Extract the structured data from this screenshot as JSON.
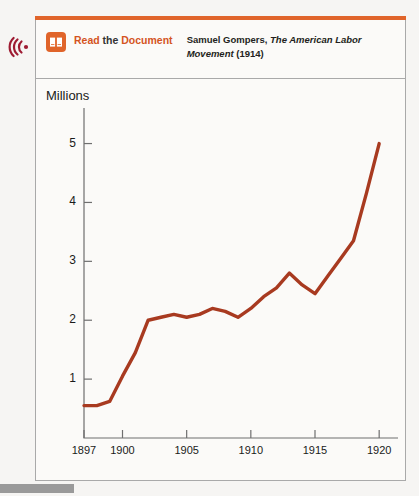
{
  "callout": {
    "audio_icon": "audio-listen-icon",
    "book_icon": "open-book-icon",
    "read_label_1": "Read",
    "read_label_2": " the ",
    "read_label_3": "Document",
    "citation_author": "Samuel Gompers, ",
    "citation_title": "The American Labor Movement",
    "citation_year": " (1914)"
  },
  "colors": {
    "accent_orange": "#e0642a",
    "line_red": "#a83a20",
    "border_gray": "#a9a9a9",
    "text_dark": "#231f20"
  },
  "chart_data": {
    "type": "line",
    "title": "",
    "xlabel": "",
    "ylabel": "Millions",
    "ylim": [
      0,
      5.4
    ],
    "xlim": [
      1897,
      1921
    ],
    "grid": false,
    "legend": null,
    "y_ticks": [
      "1",
      "2",
      "3",
      "4",
      "5"
    ],
    "y_tick_values": [
      1,
      2,
      3,
      4,
      5
    ],
    "x_ticks": [
      "1897",
      "1900",
      "1905",
      "1910",
      "1915",
      "1920"
    ],
    "x_tick_values": [
      1897,
      1900,
      1905,
      1910,
      1915,
      1920
    ],
    "series": [
      {
        "name": "Union membership",
        "color": "#a83a20",
        "x": [
          1897,
          1898,
          1899,
          1900,
          1901,
          1902,
          1903,
          1904,
          1905,
          1906,
          1907,
          1908,
          1909,
          1910,
          1911,
          1912,
          1913,
          1914,
          1915,
          1916,
          1917,
          1918,
          1919,
          1920
        ],
        "values": [
          0.55,
          0.55,
          0.62,
          1.05,
          1.45,
          2.0,
          2.05,
          2.1,
          2.05,
          2.1,
          2.2,
          2.15,
          2.05,
          2.2,
          2.4,
          2.55,
          2.8,
          2.6,
          2.45,
          2.75,
          3.05,
          3.35,
          4.15,
          5.0
        ]
      }
    ]
  },
  "bottom_bar": ""
}
